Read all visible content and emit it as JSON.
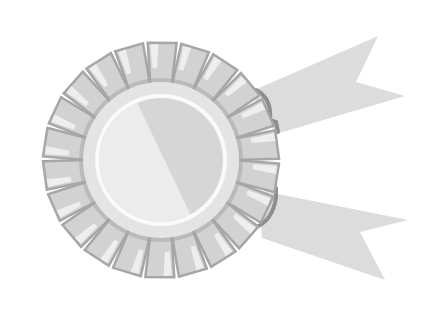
{
  "illustration": {
    "subject": "award rosette ribbon",
    "colors": {
      "background": "#ffffff",
      "ribbon": "#dcdcdc",
      "ribbon_edge": "#8e8e8e",
      "petal": "#d2d2d2",
      "petal_highlight": "#eeeeee",
      "petal_shadow": "#a6a6a6",
      "disc_outer": "#e4e4e4",
      "disc_ring": "#fafafa",
      "disc_light": "#ececec",
      "disc_dark": "#d6d6d6"
    }
  }
}
